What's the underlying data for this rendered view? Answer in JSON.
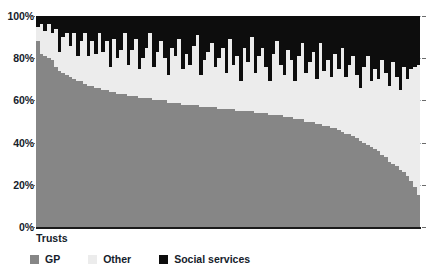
{
  "chart_data": {
    "type": "bar",
    "subtype": "stacked-bar-100-percent",
    "title": "",
    "xlabel": "Trusts",
    "ylabel": "",
    "ylim": [
      0,
      100
    ],
    "yticks": [
      0,
      20,
      40,
      60,
      80,
      100
    ],
    "ytick_labels": [
      "0%",
      "20%",
      "40%",
      "60%",
      "80%",
      "100%"
    ],
    "grid": true,
    "legend_position": "bottom",
    "colors": {
      "gp": "#868686",
      "other": "#ececec",
      "social_services": "#0d0d0d",
      "gridline": "#9aa6b0",
      "axis": "#1a1a1a",
      "text": "#15212b"
    },
    "categories": [
      "T1",
      "T2",
      "T3",
      "T4",
      "T5",
      "T6",
      "T7",
      "T8",
      "T9",
      "T10",
      "T11",
      "T12",
      "T13",
      "T14",
      "T15",
      "T16",
      "T17",
      "T18",
      "T19",
      "T20",
      "T21",
      "T22",
      "T23",
      "T24",
      "T25",
      "T26",
      "T27",
      "T28",
      "T29",
      "T30",
      "T31",
      "T32",
      "T33",
      "T34",
      "T35",
      "T36",
      "T37",
      "T38",
      "T39",
      "T40",
      "T41",
      "T42",
      "T43",
      "T44",
      "T45",
      "T46",
      "T47",
      "T48",
      "T49",
      "T50",
      "T51",
      "T52",
      "T53",
      "T54",
      "T55",
      "T56",
      "T57",
      "T58",
      "T59",
      "T60",
      "T61",
      "T62",
      "T63",
      "T64",
      "T65",
      "T66",
      "T67",
      "T68",
      "T69",
      "T70",
      "T71",
      "T72",
      "T73",
      "T74",
      "T75",
      "T76",
      "T77",
      "T78",
      "T79",
      "T80",
      "T81",
      "T82",
      "T83",
      "T84",
      "T85",
      "T86",
      "T87",
      "T88",
      "T89",
      "T90",
      "T91",
      "T92",
      "T93",
      "T94",
      "T95",
      "T96",
      "T97",
      "T98",
      "T99",
      "T100",
      "T101",
      "T102",
      "T103",
      "T104",
      "T105",
      "T106"
    ],
    "series": [
      {
        "name": "GP",
        "color": "#868686",
        "values": [
          88,
          82,
          81,
          80,
          79,
          76,
          74,
          73,
          72,
          71,
          70,
          69,
          69,
          68,
          67,
          67,
          66,
          66,
          65,
          65,
          64,
          64,
          63,
          63,
          63,
          62,
          62,
          62,
          61,
          61,
          61,
          61,
          60,
          60,
          60,
          60,
          59,
          59,
          59,
          59,
          58,
          58,
          58,
          58,
          58,
          57,
          57,
          57,
          57,
          57,
          56,
          56,
          56,
          56,
          56,
          55,
          55,
          55,
          55,
          55,
          54,
          54,
          54,
          54,
          53,
          53,
          53,
          53,
          52,
          52,
          52,
          51,
          51,
          51,
          50,
          50,
          50,
          49,
          49,
          48,
          48,
          47,
          47,
          46,
          45,
          44,
          44,
          43,
          42,
          41,
          40,
          39,
          38,
          37,
          36,
          34,
          33,
          31,
          30,
          29,
          27,
          26,
          24,
          22,
          19,
          15
        ]
      },
      {
        "name": "Other",
        "color": "#ececec",
        "values": [
          7,
          14,
          12,
          16,
          13,
          18,
          9,
          17,
          20,
          15,
          22,
          12,
          19,
          24,
          14,
          21,
          16,
          26,
          18,
          23,
          12,
          25,
          17,
          21,
          29,
          15,
          22,
          27,
          14,
          19,
          24,
          31,
          16,
          23,
          28,
          20,
          13,
          26,
          22,
          30,
          17,
          24,
          19,
          28,
          33,
          15,
          22,
          26,
          30,
          19,
          24,
          29,
          17,
          33,
          21,
          26,
          14,
          30,
          23,
          35,
          19,
          27,
          31,
          22,
          16,
          29,
          35,
          24,
          20,
          32,
          27,
          18,
          30,
          36,
          23,
          28,
          33,
          21,
          38,
          26,
          31,
          24,
          35,
          29,
          40,
          27,
          33,
          38,
          30,
          25,
          36,
          42,
          31,
          38,
          34,
          45,
          40,
          36,
          48,
          42,
          38,
          50,
          46,
          53,
          57,
          62
        ]
      },
      {
        "name": "Social services",
        "color": "#0d0d0d",
        "values": [
          5,
          4,
          7,
          4,
          8,
          6,
          17,
          10,
          8,
          14,
          8,
          19,
          12,
          8,
          19,
          12,
          18,
          8,
          17,
          12,
          24,
          11,
          20,
          16,
          8,
          23,
          16,
          11,
          25,
          20,
          15,
          8,
          24,
          17,
          12,
          20,
          28,
          15,
          19,
          11,
          25,
          18,
          23,
          14,
          9,
          28,
          21,
          17,
          13,
          24,
          20,
          15,
          27,
          11,
          23,
          19,
          31,
          15,
          22,
          10,
          27,
          19,
          15,
          24,
          31,
          18,
          12,
          23,
          28,
          16,
          21,
          31,
          19,
          13,
          27,
          22,
          17,
          30,
          13,
          26,
          21,
          29,
          18,
          25,
          15,
          29,
          23,
          19,
          28,
          34,
          24,
          19,
          31,
          25,
          30,
          21,
          27,
          33,
          22,
          29,
          35,
          24,
          30,
          25,
          24,
          23
        ]
      }
    ],
    "legend": [
      {
        "label": "GP",
        "color": "#868686",
        "swatch": "gp-swatch"
      },
      {
        "label": "Other",
        "color": "#ececec",
        "swatch": "other-swatch"
      },
      {
        "label": "Social services",
        "color": "#0d0d0d",
        "swatch": "social-services-swatch"
      }
    ]
  }
}
